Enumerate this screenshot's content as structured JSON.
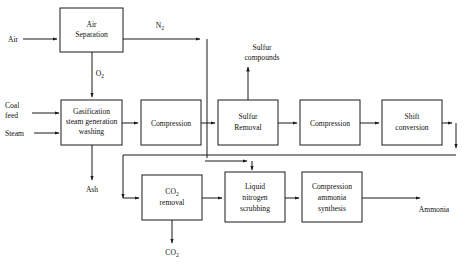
{
  "diagram": {
    "type": "process-flow-diagram",
    "colors": {
      "line": "#1a1a1a",
      "box_fill": "#ffffff",
      "background": "#ffffff",
      "text": "#111111"
    },
    "process_boxes": [
      {
        "id": "air-separation",
        "line1": "Air",
        "line2": "Separation",
        "line3": ""
      },
      {
        "id": "gasification",
        "line1": "Gasification",
        "line2": "steam generation",
        "line3": "washing"
      },
      {
        "id": "compression-1",
        "line1": "Compression",
        "line2": "",
        "line3": ""
      },
      {
        "id": "sulfur-removal",
        "line1": "Sulfur",
        "line2": "Removal",
        "line3": ""
      },
      {
        "id": "compression-2",
        "line1": "Compression",
        "line2": "",
        "line3": ""
      },
      {
        "id": "shift-conversion",
        "line1": "Shift",
        "line2": "conversion",
        "line3": ""
      },
      {
        "id": "co2-removal",
        "line1": "CO2",
        "line2": "removal",
        "line3": ""
      },
      {
        "id": "liquid-nitrogen-scrub",
        "line1": "Liquid",
        "line2": "nitrogen",
        "line3": "scrubbing"
      },
      {
        "id": "ammonia-synthesis",
        "line1": "Compression",
        "line2": "ammonia",
        "line3": "synthesis"
      }
    ],
    "stream_labels": {
      "air": "Air",
      "nitrogen": "N2",
      "oxygen": "O2",
      "coal_feed_line1": "Coal",
      "coal_feed_line2": "feed",
      "steam": "Steam",
      "sulfur_compounds_line1": "Sulfur",
      "sulfur_compounds_line2": "compounds",
      "ash": "Ash",
      "carbon_dioxide": "CO2",
      "ammonia": "Ammonia"
    },
    "subscripts": {
      "nitrogen_base": "N",
      "nitrogen_sub": "2",
      "oxygen_base": "O",
      "oxygen_sub": "2",
      "co2_base": "CO",
      "co2_sub": "2"
    }
  }
}
